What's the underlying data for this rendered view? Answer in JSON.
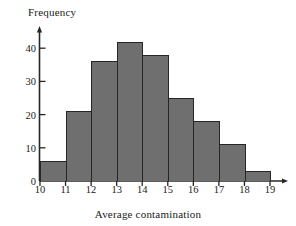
{
  "chart_data": {
    "type": "bar",
    "title": "",
    "subtitle": "",
    "xlabel": "Average contamination",
    "ylabel": "Frequency",
    "categories": [
      "10-11",
      "11-12",
      "12-13",
      "13-14",
      "14-15",
      "15-16",
      "16-17",
      "17-18",
      "18-19"
    ],
    "bin_edges": [
      10,
      11,
      12,
      13,
      14,
      15,
      16,
      17,
      18,
      19
    ],
    "values": [
      6,
      21,
      36,
      42,
      38,
      25,
      18,
      11,
      3
    ],
    "x_tick_labels": [
      "10",
      "11",
      "12",
      "13",
      "14",
      "15",
      "16",
      "17",
      "18",
      "19"
    ],
    "y_tick_labels": [
      "0",
      "10",
      "20",
      "30",
      "40"
    ],
    "y_tick_values": [
      0,
      10,
      20,
      30,
      40
    ],
    "xlim": [
      10,
      19
    ],
    "ylim": [
      0,
      45
    ],
    "grid": false,
    "legend": null,
    "bar_fill_color": "#706f6f",
    "bar_edge_color": "#262626",
    "axis_color": "#262626",
    "background_color": "#ffffff"
  },
  "axes": {
    "y_title": "Frequency",
    "x_title": "Average contamination"
  }
}
